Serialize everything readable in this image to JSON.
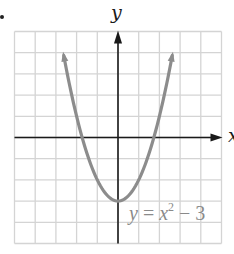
{
  "chart_data": {
    "type": "line",
    "title": "",
    "xlabel": "x",
    "ylabel": "y",
    "xlim": [
      -5,
      5
    ],
    "ylim": [
      -5,
      5
    ],
    "grid": true,
    "grid_step": 1,
    "series": [
      {
        "name": "y = x^2 - 3",
        "function": "x^2 - 3",
        "x": [
          -2.8,
          -2.5,
          -2,
          -1.5,
          -1,
          -0.5,
          0,
          0.5,
          1,
          1.5,
          2,
          2.5,
          2.8
        ],
        "values": [
          4.84,
          3.25,
          1,
          -0.75,
          -2,
          -2.75,
          -3,
          -2.75,
          -2,
          -0.75,
          1,
          3.25,
          4.84
        ],
        "vertex": [
          0,
          -3
        ],
        "color": "#8c8c8c",
        "arrows_at_ends": true
      }
    ],
    "annotations": [
      {
        "text": "y = x² − 3",
        "x": 1.9,
        "y": -3.7
      }
    ]
  },
  "labels": {
    "x_axis": "x",
    "y_axis": "y",
    "equation_lhs": "y",
    "equation_eq": " = ",
    "equation_var": "x",
    "equation_exp": "2",
    "equation_rest": " − 3"
  },
  "colors": {
    "grid": "#d4d4d4",
    "axes": "#1a1a1a",
    "curve": "#8c8c8c",
    "label": "#8a8a8a"
  }
}
